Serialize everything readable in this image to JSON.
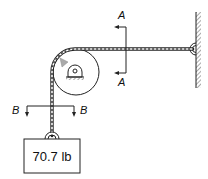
{
  "diagram": {
    "type": "mechanics-free-body",
    "section_labels": {
      "a_top": "A",
      "a_bottom": "A",
      "b_left": "B",
      "b_right": "B"
    },
    "weight_label": "70.7 lb",
    "colors": {
      "line": "#222222",
      "hatch": "#555555",
      "rope_fill": "#ffffff",
      "pointer": "#999999"
    },
    "components": [
      "wall",
      "wall-anchor",
      "horizontal-rope",
      "pulley",
      "pulley-support",
      "vertical-rope",
      "weight-hook",
      "weight-box",
      "section-A-A",
      "section-B-B"
    ]
  }
}
